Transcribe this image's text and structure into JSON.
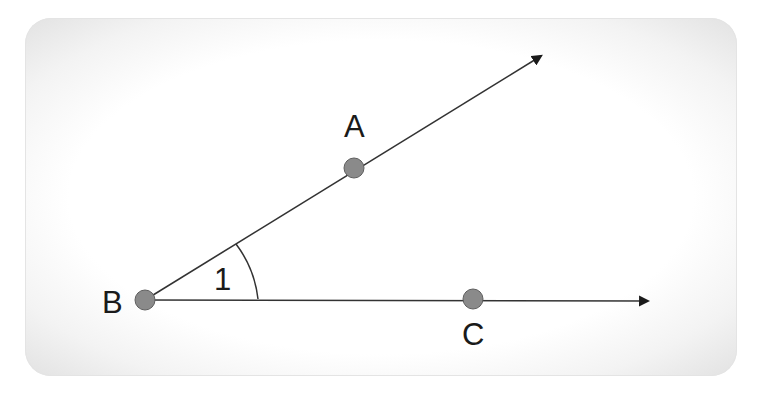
{
  "diagram": {
    "title": "",
    "type": "angle",
    "colors": {
      "line": "#333333",
      "point_fill": "#8a8a8a",
      "point_stroke": "#5a5a5a",
      "label": "#1a1a1a",
      "card_edge": "#e2e2e2"
    },
    "points": [
      {
        "id": "A",
        "label": "A",
        "x": 354,
        "y": 168
      },
      {
        "id": "B",
        "label": "B",
        "x": 145,
        "y": 300
      },
      {
        "id": "C",
        "label": "C",
        "x": 473,
        "y": 299
      }
    ],
    "rays": [
      {
        "id": "ray-BA",
        "from": "B",
        "through": "A",
        "arrow_tip": {
          "x": 543,
          "y": 54
        }
      },
      {
        "id": "ray-BC",
        "from": "B",
        "through": "C",
        "arrow_tip": {
          "x": 651,
          "y": 301
        }
      }
    ],
    "angle": {
      "label": "1",
      "vertex": "B",
      "between": [
        "ray-BA",
        "ray-BC"
      ]
    },
    "labels": {
      "A": "A",
      "B": "B",
      "C": "C",
      "angle": "1"
    }
  }
}
